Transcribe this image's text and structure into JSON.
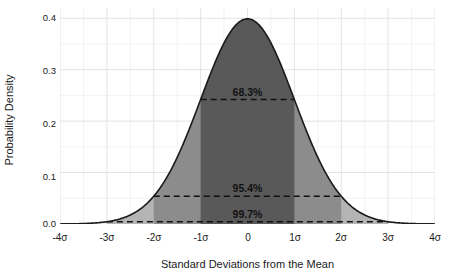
{
  "chart_data": {
    "type": "area",
    "title": "",
    "subtitle": "",
    "xlabel": "Standard Deviations from the Mean",
    "ylabel": "Probability Density",
    "xlim": [
      -4,
      4
    ],
    "ylim": [
      0.0,
      0.42
    ],
    "grid": true,
    "legend": null,
    "curve": {
      "name": "Standard Normal Distribution",
      "formula": "phi(x) = exp(-x^2/2)/sqrt(2*pi)",
      "peak_x": 0,
      "peak_y": 0.3989,
      "line_color": "#1a1a1a",
      "x": [
        -4.0,
        -3.75,
        -3.5,
        -3.25,
        -3.0,
        -2.75,
        -2.5,
        -2.25,
        -2.0,
        -1.75,
        -1.5,
        -1.25,
        -1.0,
        -0.75,
        -0.5,
        -0.25,
        0.0,
        0.25,
        0.5,
        0.75,
        1.0,
        1.25,
        1.5,
        1.75,
        2.0,
        2.25,
        2.5,
        2.75,
        3.0,
        3.25,
        3.5,
        3.75,
        4.0
      ],
      "y": [
        0.0001,
        0.0004,
        0.0009,
        0.002,
        0.0044,
        0.0091,
        0.0175,
        0.0317,
        0.054,
        0.0863,
        0.1295,
        0.1826,
        0.242,
        0.3011,
        0.3521,
        0.3867,
        0.3989,
        0.3867,
        0.3521,
        0.3011,
        0.242,
        0.1826,
        0.1295,
        0.0863,
        0.054,
        0.0317,
        0.0175,
        0.0091,
        0.0044,
        0.002,
        0.0009,
        0.0004,
        0.0001
      ]
    },
    "shaded_bands": [
      {
        "id": "band-3sigma",
        "label": "99.7%",
        "from": -3,
        "to": 3,
        "color": "#b4b4b4",
        "line_y": 0.0044
      },
      {
        "id": "band-2sigma",
        "label": "95.4%",
        "from": -2,
        "to": 2,
        "color": "#8c8c8c",
        "line_y": 0.054
      },
      {
        "id": "band-1sigma",
        "label": "68.3%",
        "from": -1,
        "to": 1,
        "color": "#595959",
        "line_y": 0.242
      }
    ],
    "xticks": [
      {
        "value": -4,
        "label": "-4σ"
      },
      {
        "value": -3,
        "label": "-3σ"
      },
      {
        "value": -2,
        "label": "-2σ"
      },
      {
        "value": -1,
        "label": "-1σ"
      },
      {
        "value": 0,
        "label": "0"
      },
      {
        "value": 1,
        "label": "1σ"
      },
      {
        "value": 2,
        "label": "2σ"
      },
      {
        "value": 3,
        "label": "3σ"
      },
      {
        "value": 4,
        "label": "4σ"
      }
    ],
    "yticks": [
      {
        "value": 0.0,
        "label": "0.0"
      },
      {
        "value": 0.1,
        "label": "0.1"
      },
      {
        "value": 0.2,
        "label": "0.2"
      },
      {
        "value": 0.3,
        "label": "0.3"
      },
      {
        "value": 0.4,
        "label": "0.4"
      }
    ],
    "minor_yticks": [
      0.05,
      0.15,
      0.25,
      0.35
    ],
    "minor_xticks": [
      -3.5,
      -2.5,
      -1.5,
      -0.5,
      0.5,
      1.5,
      2.5,
      3.5
    ],
    "annotations": [
      {
        "text": "68.3%",
        "x": 0,
        "y": 0.242,
        "position": "above-line"
      },
      {
        "text": "95.4%",
        "x": 0,
        "y": 0.054,
        "position": "above-line"
      },
      {
        "text": "99.7%",
        "x": 0,
        "y": 0.0044,
        "position": "above-line"
      }
    ],
    "colors": {
      "background": "#ffffff",
      "grid_major": "#e3e3e3",
      "grid_minor": "#f0f0f0",
      "curve": "#1a1a1a",
      "dashed_line": "#111111",
      "text": "#1a1a1a"
    }
  }
}
